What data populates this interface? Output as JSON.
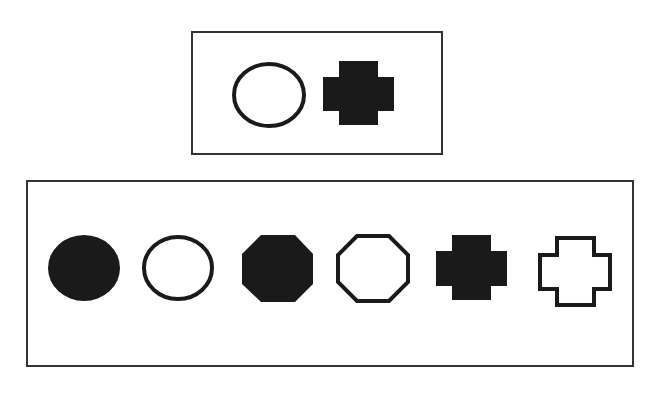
{
  "caption": {
    "text": "",
    "note": "clipped text line at top edge, illegible"
  },
  "colors": {
    "ink": "#1a1a1a",
    "border": "#333333",
    "background": "#ffffff"
  },
  "question_panel": {
    "label": "sample pair",
    "shapes": [
      {
        "type": "circle",
        "fill": "outline"
      },
      {
        "type": "cross",
        "fill": "filled"
      }
    ]
  },
  "options_panel": {
    "label": "candidate shapes",
    "shapes": [
      {
        "type": "circle",
        "fill": "filled"
      },
      {
        "type": "circle",
        "fill": "outline"
      },
      {
        "type": "octagon",
        "fill": "filled"
      },
      {
        "type": "octagon",
        "fill": "outline"
      },
      {
        "type": "cross",
        "fill": "filled"
      },
      {
        "type": "cross",
        "fill": "outline"
      }
    ]
  }
}
